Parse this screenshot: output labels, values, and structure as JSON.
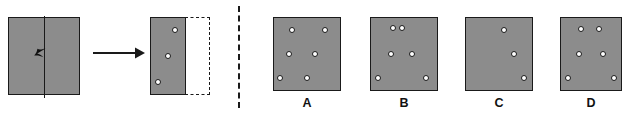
{
  "puzzle": {
    "type": "paper-folding-punch",
    "prompt_panel": {
      "start_square": {
        "fold_line_orientation": "vertical",
        "fold_direction_icon": "left-arrowhead"
      },
      "transform_arrow_icon": "right-arrow",
      "folded_piece": {
        "shape": "rectangle",
        "hole_count": 3,
        "holes": [
          {
            "label": "top-right",
            "x_pct": 72,
            "y_pct": 16
          },
          {
            "label": "middle-center",
            "x_pct": 50,
            "y_pct": 50
          },
          {
            "label": "bottom-left",
            "x_pct": 22,
            "y_pct": 84
          }
        ]
      },
      "ghost_outline": {
        "style": "dashed",
        "meaning": "unfolded-half"
      }
    },
    "divider": {
      "orientation": "vertical",
      "style": "dashed"
    },
    "options": [
      {
        "label": "A",
        "hole_count": 6,
        "holes": [
          {
            "x_pct": 28,
            "y_pct": 17
          },
          {
            "x_pct": 78,
            "y_pct": 17
          },
          {
            "x_pct": 22,
            "y_pct": 50
          },
          {
            "x_pct": 62,
            "y_pct": 50
          },
          {
            "x_pct": 9,
            "y_pct": 83
          },
          {
            "x_pct": 50,
            "y_pct": 83
          }
        ]
      },
      {
        "label": "B",
        "hole_count": 6,
        "holes": [
          {
            "x_pct": 34,
            "y_pct": 14
          },
          {
            "x_pct": 47,
            "y_pct": 14
          },
          {
            "x_pct": 30,
            "y_pct": 50
          },
          {
            "x_pct": 62,
            "y_pct": 50
          },
          {
            "x_pct": 10,
            "y_pct": 83
          },
          {
            "x_pct": 84,
            "y_pct": 83
          }
        ]
      },
      {
        "label": "C",
        "hole_count": 3,
        "holes": [
          {
            "x_pct": 58,
            "y_pct": 16
          },
          {
            "x_pct": 72,
            "y_pct": 50
          },
          {
            "x_pct": 88,
            "y_pct": 84
          }
        ]
      },
      {
        "label": "D",
        "hole_count": 6,
        "holes": [
          {
            "x_pct": 33,
            "y_pct": 15
          },
          {
            "x_pct": 63,
            "y_pct": 15
          },
          {
            "x_pct": 30,
            "y_pct": 50
          },
          {
            "x_pct": 70,
            "y_pct": 50
          },
          {
            "x_pct": 11,
            "y_pct": 84
          },
          {
            "x_pct": 89,
            "y_pct": 84
          }
        ]
      }
    ]
  },
  "colors": {
    "paper_fill": "#8c8c8c",
    "outline": "#1a1a1a",
    "hole_fill": "#ffffff",
    "background": "#ffffff"
  }
}
